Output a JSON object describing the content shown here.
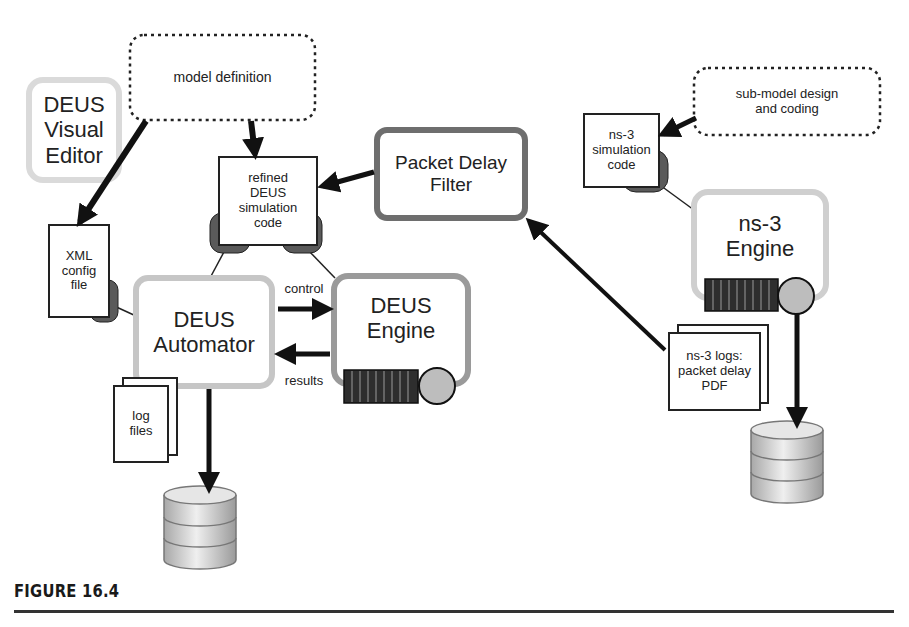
{
  "figure": {
    "caption": "FIGURE 16.4"
  },
  "nodes": {
    "model_definition": {
      "label": "model definition",
      "style": "dashed-cloud"
    },
    "deus_visual_editor": {
      "label_lines": [
        "DEUS",
        "Visual",
        "Editor"
      ],
      "style": "light-rounded"
    },
    "xml_config_file": {
      "label_lines": [
        "XML",
        "config",
        "file"
      ],
      "style": "document"
    },
    "refined_deus_code": {
      "label_lines": [
        "refined",
        "DEUS",
        "simulation",
        "code"
      ],
      "style": "document"
    },
    "packet_delay_filter": {
      "label_lines": [
        "Packet Delay",
        "Filter"
      ],
      "style": "dark-rounded"
    },
    "deus_automator": {
      "label_lines": [
        "DEUS",
        "Automator"
      ],
      "style": "light-rounded"
    },
    "deus_engine": {
      "label_lines": [
        "DEUS",
        "Engine"
      ],
      "style": "medium-rounded"
    },
    "log_files": {
      "label_lines": [
        "log",
        "files"
      ],
      "style": "stacked-document"
    },
    "sub_model_design": {
      "label_lines": [
        "sub-model design",
        "and coding"
      ],
      "style": "dashed-cloud"
    },
    "ns3_simulation_code": {
      "label_lines": [
        "ns-3",
        "simulation",
        "code"
      ],
      "style": "document"
    },
    "ns3_engine": {
      "label_lines": [
        "ns-3",
        "Engine"
      ],
      "style": "light-rounded"
    },
    "ns3_logs": {
      "label_lines": [
        "ns-3 logs:",
        "packet delay",
        "PDF"
      ],
      "style": "stacked-document"
    }
  },
  "edges": {
    "control_label": "control",
    "results_label": "results"
  },
  "colors": {
    "light_border": "#cfcfcf",
    "medium_border": "#9a9a9a",
    "dark_border": "#6e6e6e",
    "plug_fill": "#5a5a5a",
    "queue_fill": "#2e2e2e",
    "server_fill": "#bdbdbd",
    "arrow": "#111111"
  }
}
